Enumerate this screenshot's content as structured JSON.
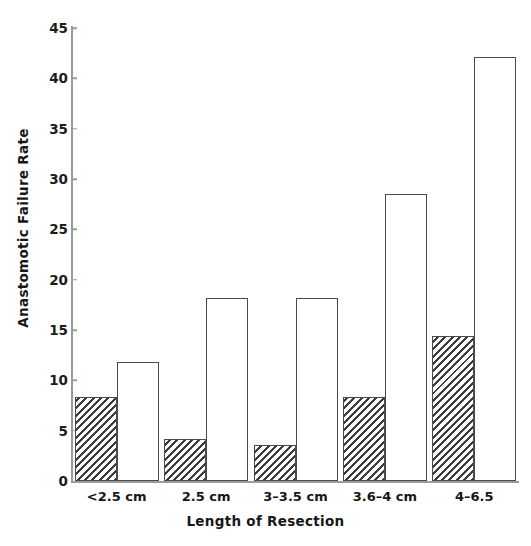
{
  "chart_data": {
    "type": "bar",
    "title": "",
    "xlabel": "Length of Resection",
    "ylabel": "Anastomotic Failure Rate",
    "categories": [
      "<2.5 cm",
      "2.5 cm",
      "3–3.5 cm",
      "3.6–4 cm",
      "4–6.5"
    ],
    "series": [
      {
        "name": "hatched",
        "pattern": "diagonal-hatch",
        "values": [
          8.3,
          4.2,
          3.6,
          8.3,
          14.4
        ]
      },
      {
        "name": "open",
        "pattern": "solid-white",
        "values": [
          11.8,
          18.2,
          18.2,
          28.5,
          42.1
        ]
      }
    ],
    "ylim": [
      0,
      45
    ],
    "yticks": [
      0,
      5,
      10,
      15,
      20,
      25,
      30,
      35,
      40,
      45
    ],
    "ytick_labels": [
      "0",
      "5",
      "10",
      "15",
      "20",
      "25",
      "30",
      "35",
      "40",
      "45"
    ],
    "grid": false,
    "legend": "none",
    "axis_color": "#9a9a9a",
    "bar_edge_color": "#4a4a4a",
    "hatch_color": "#3d3d3d",
    "text_color": "#171717"
  }
}
